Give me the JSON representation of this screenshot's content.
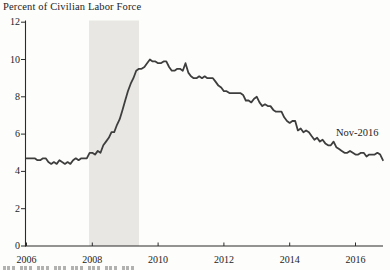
{
  "colors": {
    "background": "#fdfdfb",
    "text": "#1c1c1c",
    "axis": "#2b2b2b",
    "line": "#3e3e3e",
    "recession_band": "#e8e7e3"
  },
  "chart_data": {
    "type": "line",
    "title": "Percent of Civilian Labor Force",
    "xlabel": "",
    "ylabel": "Percent of Civilian Labor Force",
    "frequency": "monthly",
    "start_date": "2006-01",
    "end_date": "2016-11",
    "ylim": [
      0,
      12
    ],
    "xlim": [
      2006,
      2016.95
    ],
    "grid": false,
    "legend": "none",
    "y_ticks": [
      0,
      2,
      4,
      6,
      8,
      10,
      12
    ],
    "x_ticks": [
      2006,
      2008,
      2010,
      2012,
      2014,
      2016
    ],
    "shaded_region": {
      "from_year": 2007.9,
      "to_year": 2009.42
    },
    "annotation": {
      "text": "Nov-2016",
      "x_year": 2016.83,
      "y_value": 4.6
    },
    "values": [
      4.7,
      4.7,
      4.7,
      4.7,
      4.6,
      4.6,
      4.7,
      4.7,
      4.5,
      4.4,
      4.5,
      4.4,
      4.6,
      4.5,
      4.4,
      4.5,
      4.4,
      4.6,
      4.7,
      4.6,
      4.7,
      4.7,
      4.7,
      5.0,
      5.0,
      4.9,
      5.1,
      5.0,
      5.4,
      5.6,
      5.8,
      6.1,
      6.1,
      6.5,
      6.8,
      7.3,
      7.8,
      8.3,
      8.7,
      9.0,
      9.4,
      9.5,
      9.5,
      9.6,
      9.8,
      10.0,
      9.9,
      9.9,
      9.8,
      9.8,
      9.9,
      9.9,
      9.6,
      9.4,
      9.4,
      9.5,
      9.5,
      9.4,
      9.8,
      9.3,
      9.1,
      9.0,
      9.0,
      9.1,
      9.0,
      9.1,
      9.0,
      9.0,
      9.0,
      8.8,
      8.6,
      8.5,
      8.3,
      8.3,
      8.2,
      8.2,
      8.2,
      8.2,
      8.2,
      8.1,
      7.8,
      7.8,
      7.7,
      7.9,
      8.0,
      7.7,
      7.5,
      7.6,
      7.5,
      7.5,
      7.3,
      7.2,
      7.2,
      7.2,
      6.9,
      6.7,
      6.6,
      6.7,
      6.7,
      6.2,
      6.3,
      6.1,
      6.2,
      6.1,
      5.9,
      5.7,
      5.8,
      5.6,
      5.7,
      5.5,
      5.4,
      5.4,
      5.6,
      5.3,
      5.2,
      5.1,
      5.0,
      5.0,
      5.1,
      5.0,
      4.9,
      4.9,
      5.0,
      5.0,
      4.8,
      4.9,
      4.9,
      4.9,
      5.0,
      4.9,
      4.6
    ]
  }
}
